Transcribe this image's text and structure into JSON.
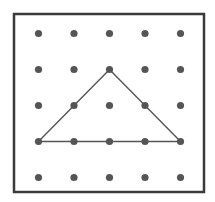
{
  "figure": {
    "name": "geoboard-triangle",
    "caption": "",
    "background_color": "#ffffff"
  },
  "board": {
    "name": "geoboard",
    "frame": {
      "x": 14,
      "y": 14,
      "width": 190,
      "height": 178,
      "stroke_color": "#3a3a3a",
      "stroke_width": 2.5,
      "fill_color": "#ffffff"
    },
    "grid": {
      "rows": 5,
      "columns": 5,
      "origin_x": 38.5,
      "origin_y": 33.5,
      "spacing_x": 35.5,
      "spacing_y": 36,
      "peg_radius": 3.6,
      "peg_color": "#555555"
    }
  },
  "chart_data": {
    "type": "scatter",
    "title": "",
    "xlabel": "",
    "ylabel": "",
    "xlim": [
      0,
      4
    ],
    "ylim": [
      0,
      4
    ],
    "grid": false,
    "legend_position": "none",
    "pegs": [
      {
        "col": 0,
        "row": 0
      },
      {
        "col": 1,
        "row": 0
      },
      {
        "col": 2,
        "row": 0
      },
      {
        "col": 3,
        "row": 0
      },
      {
        "col": 4,
        "row": 0
      },
      {
        "col": 0,
        "row": 1
      },
      {
        "col": 1,
        "row": 1
      },
      {
        "col": 2,
        "row": 1
      },
      {
        "col": 3,
        "row": 1
      },
      {
        "col": 4,
        "row": 1
      },
      {
        "col": 0,
        "row": 2
      },
      {
        "col": 1,
        "row": 2
      },
      {
        "col": 2,
        "row": 2
      },
      {
        "col": 3,
        "row": 2
      },
      {
        "col": 4,
        "row": 2
      },
      {
        "col": 0,
        "row": 3
      },
      {
        "col": 1,
        "row": 3
      },
      {
        "col": 2,
        "row": 3
      },
      {
        "col": 3,
        "row": 3
      },
      {
        "col": 4,
        "row": 3
      },
      {
        "col": 0,
        "row": 4
      },
      {
        "col": 1,
        "row": 4
      },
      {
        "col": 2,
        "row": 4
      },
      {
        "col": 3,
        "row": 4
      },
      {
        "col": 4,
        "row": 4
      }
    ],
    "shapes": [
      {
        "name": "triangle",
        "kind": "polygon",
        "closed": true,
        "fill": "none",
        "stroke_color": "#555555",
        "stroke_width": 1.4,
        "vertices_grid": [
          {
            "col": 0,
            "row": 3
          },
          {
            "col": 2,
            "row": 1
          },
          {
            "col": 4,
            "row": 3
          }
        ],
        "vertices_px": [
          {
            "x": 38.5,
            "y": 141.5
          },
          {
            "x": 109.5,
            "y": 69.5
          },
          {
            "x": 180.5,
            "y": 141.5
          }
        ],
        "base_length_units": 4,
        "height_units": 2
      }
    ]
  }
}
